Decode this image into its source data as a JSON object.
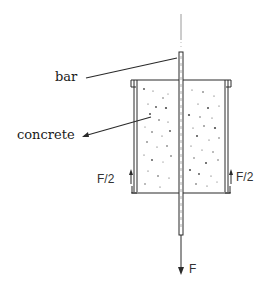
{
  "diagram": {
    "labels": {
      "bar": "bar",
      "concrete": "concrete",
      "force_total": "F",
      "force_half_left": "F/2",
      "force_half_right": "F/2"
    },
    "colors": {
      "stroke": "#2a2a2a",
      "light_stroke": "#8a8a8a",
      "speckle": "#4a4a4a",
      "background": "#ffffff"
    }
  }
}
